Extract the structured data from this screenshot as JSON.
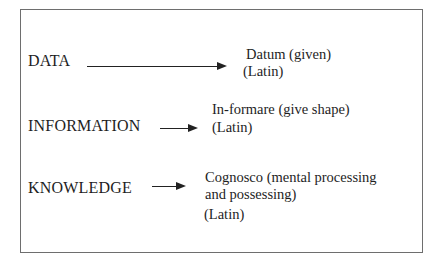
{
  "diagram": {
    "rows": [
      {
        "term": "DATA",
        "meaning_lines": [
          "Datum (given)"
        ],
        "origin": "(Latin)"
      },
      {
        "term": "INFORMATION",
        "meaning_lines": [
          "In-formare (give shape)"
        ],
        "origin": "(Latin)"
      },
      {
        "term": "KNOWLEDGE",
        "meaning_lines": [
          "Cognosco (mental processing",
          "and possessing)"
        ],
        "origin": "(Latin)"
      }
    ],
    "colors": {
      "border": "#6e6e6e",
      "text": "#1e1e1e",
      "arrow": "#222222"
    }
  }
}
